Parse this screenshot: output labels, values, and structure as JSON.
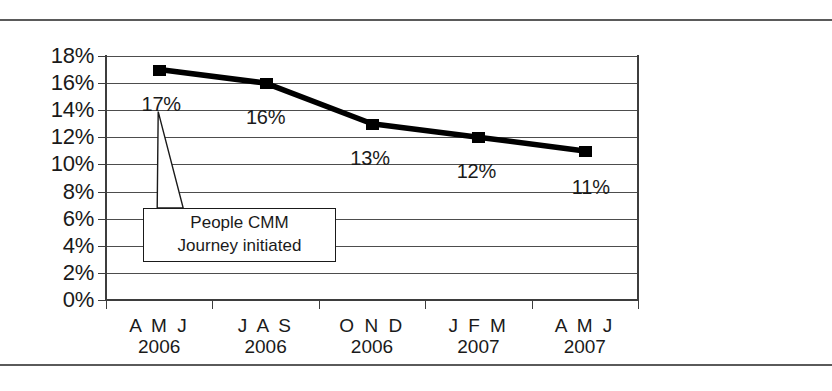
{
  "chart_data": {
    "type": "line",
    "title": "",
    "xlabel": "",
    "ylabel": "",
    "categories": [
      "A M J\n2006",
      "J A S\n2006",
      "O N D\n2006",
      "J F M\n2007",
      "A M J\n2007"
    ],
    "category_months": [
      "A M J",
      "J A S",
      "O N D",
      "J F M",
      "A M J"
    ],
    "category_years": [
      "2006",
      "2006",
      "2006",
      "2007",
      "2007"
    ],
    "values": [
      17,
      16,
      13,
      12,
      11
    ],
    "data_labels": [
      "17%",
      "16%",
      "13%",
      "12%",
      "11%"
    ],
    "ylim": [
      0,
      18
    ],
    "ytick_values": [
      18,
      16,
      14,
      12,
      10,
      8,
      6,
      4,
      2,
      0
    ],
    "ytick_labels": [
      "18%",
      "16%",
      "14%",
      "12%",
      "10%",
      "8%",
      "6%",
      "4%",
      "2%",
      "0%"
    ],
    "grid": true,
    "legend": "none",
    "series_color": "#000000",
    "grid_color": "#4d4d4d",
    "annotations": [
      {
        "name": "people-cmm-callout",
        "line1": "People CMM",
        "line2": "Journey initiated",
        "points_to_category": "A M J 2006"
      }
    ]
  },
  "callout": {
    "line1": "People CMM",
    "line2": "Journey initiated"
  }
}
